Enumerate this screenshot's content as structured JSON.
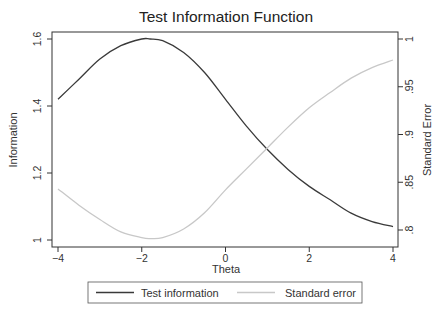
{
  "chart_data": {
    "type": "line",
    "title": "Test Information Function",
    "xlabel": "Theta",
    "ylabel": "Information",
    "y2label": "Standard Error",
    "xlim": [
      -4,
      4
    ],
    "ylim": [
      0.98,
      1.62
    ],
    "y2lim": [
      0.793,
      1.0
    ],
    "x_ticks": [
      -4,
      -2,
      0,
      2,
      4
    ],
    "x_tick_labels": [
      "−4",
      "−2",
      "0",
      "2",
      "4"
    ],
    "y_ticks": [
      1,
      1.2,
      1.4,
      1.6
    ],
    "y_tick_labels": [
      "1",
      "1.2",
      "1.4",
      "1.6"
    ],
    "y2_ticks": [
      0.8,
      0.85,
      0.9,
      0.95,
      1
    ],
    "y2_tick_labels": [
      ".8",
      ".85",
      ".9",
      ".95",
      "1"
    ],
    "grid": false,
    "legend_position": "bottom",
    "x": [
      -4,
      -3.5,
      -3,
      -2.5,
      -2,
      -1.8,
      -1.5,
      -1,
      -0.5,
      0,
      0.5,
      1,
      1.5,
      2,
      2.5,
      3,
      3.5,
      4
    ],
    "series": [
      {
        "name": "Test information",
        "axis": "left",
        "color": "#3a3a3a",
        "values": [
          1.42,
          1.48,
          1.54,
          1.58,
          1.6,
          1.6,
          1.595,
          1.56,
          1.5,
          1.42,
          1.34,
          1.27,
          1.21,
          1.16,
          1.12,
          1.08,
          1.055,
          1.04
        ]
      },
      {
        "name": "Standard error",
        "axis": "right",
        "color": "#c8c8c8",
        "values": [
          0.843,
          0.826,
          0.811,
          0.798,
          0.792,
          0.791,
          0.792,
          0.801,
          0.818,
          0.842,
          0.864,
          0.886,
          0.908,
          0.928,
          0.944,
          0.959,
          0.97,
          0.978
        ]
      }
    ]
  },
  "legend": {
    "items": [
      {
        "label": "Test information",
        "color": "#3a3a3a"
      },
      {
        "label": "Standard error",
        "color": "#c8c8c8"
      }
    ]
  }
}
